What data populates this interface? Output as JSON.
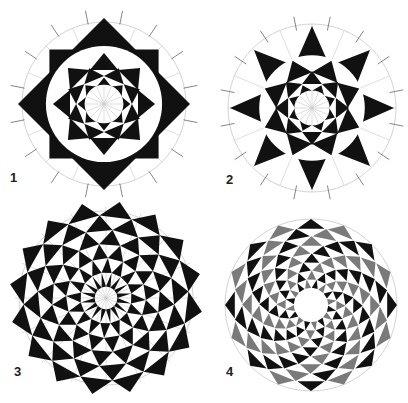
{
  "colors": {
    "ink": "#111111",
    "gray": "#7a7a7a",
    "guide": "#c8c8c8",
    "bg": "#ffffff"
  },
  "panels": [
    {
      "label": "1",
      "cx": 104,
      "cy": 104,
      "r": 88,
      "type": "octagram-squares",
      "folds": 8,
      "label_x": 10,
      "label_y": 178
    },
    {
      "label": "2",
      "cx": 312,
      "cy": 108,
      "r": 88,
      "type": "star-8",
      "folds": 8,
      "label_x": 226,
      "label_y": 180
    },
    {
      "label": "3",
      "cx": 106,
      "cy": 298,
      "r": 95,
      "type": "spiral-star",
      "folds": 16,
      "label_x": 14,
      "label_y": 372
    },
    {
      "label": "4",
      "cx": 311,
      "cy": 305,
      "r": 86,
      "type": "spiral-rings",
      "folds": 16,
      "label_x": 226,
      "label_y": 372
    }
  ]
}
